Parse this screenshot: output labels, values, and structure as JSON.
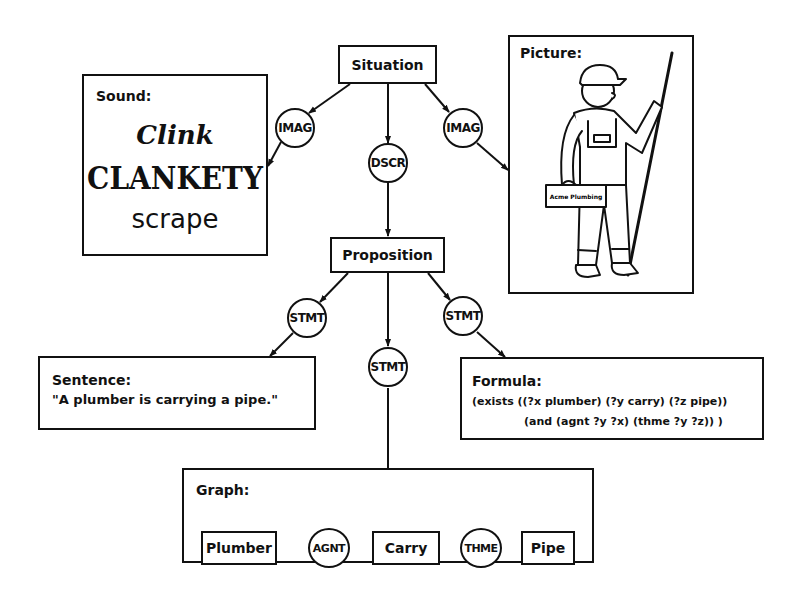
{
  "nodes": {
    "situation": "Situation",
    "proposition": "Proposition",
    "imag_left": "IMAG",
    "imag_right": "IMAG",
    "dscr": "DSCR",
    "stmt_left": "STMT",
    "stmt_center": "STMT",
    "stmt_right": "STMT"
  },
  "sound": {
    "title": "Sound:",
    "words": [
      "Clink",
      "CLANKETY",
      "scrape"
    ]
  },
  "picture": {
    "title": "Picture:",
    "toolbox_label": "Acme Plumbing"
  },
  "sentence": {
    "title": "Sentence:",
    "text": "\"A plumber is carrying a pipe.\""
  },
  "formula": {
    "title": "Formula:",
    "line1": "(exists ((?x plumber) (?y carry) (?z pipe))",
    "line2": "(and (agnt ?y ?x) (thme ?y ?z)) )"
  },
  "graph": {
    "title": "Graph:",
    "concepts": [
      "Plumber",
      "Carry",
      "Pipe"
    ],
    "relations": [
      "AGNT",
      "THME"
    ]
  }
}
